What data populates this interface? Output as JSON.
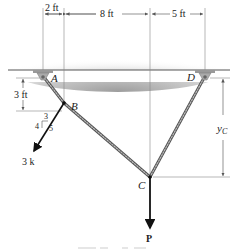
{
  "diagram": {
    "type": "cable-system",
    "points": {
      "A": {
        "label": "A"
      },
      "B": {
        "label": "B"
      },
      "C": {
        "label": "C"
      },
      "D": {
        "label": "D"
      }
    },
    "dimensions": {
      "ab_horizontal": "2 ft",
      "bc_horizontal": "8 ft",
      "cd_horizontal": "5 ft",
      "ab_vertical": "3 ft",
      "yc": "y",
      "yc_sub": "C"
    },
    "loads": {
      "b_force": "3 k",
      "slope_rise": "4",
      "slope_run": "3",
      "slope_hyp": "5",
      "c_force": "P"
    },
    "colors": {
      "cable": "#8a8a8a",
      "support": "#9a9a9a",
      "ceiling_shade": "#b8b8b8",
      "arrow": "#111111",
      "dim_line": "#777777"
    }
  }
}
